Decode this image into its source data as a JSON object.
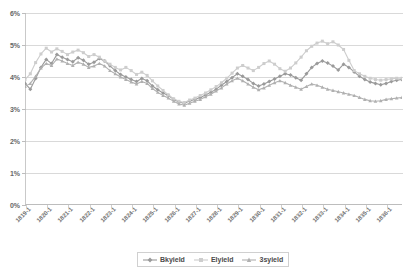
{
  "chart_data": {
    "type": "line",
    "title": "",
    "subtitle": "",
    "xlabel": "",
    "ylabel": "",
    "grid": true,
    "legend_position": "bottom",
    "ylim": [
      0,
      6
    ],
    "ytick_labels": [
      "6%",
      "5%",
      "4%",
      "3%",
      "2%",
      "1%",
      "0%"
    ],
    "ytick_values": [
      6,
      5,
      4,
      3,
      2,
      1,
      0
    ],
    "xtick_labels": [
      "1819-1",
      "1820-1",
      "1821-1",
      "1822-1",
      "1823-1",
      "1824-1",
      "1825-1",
      "1826-1",
      "1827-1",
      "1828-1",
      "1829-1",
      "1830-1",
      "1831-1",
      "1832-1",
      "1833-1",
      "1834-1",
      "1835-1",
      "1836-1"
    ],
    "x_unit": "year-quarter",
    "x_start": "1819-1",
    "x_end": "1836-4",
    "n_points": 72,
    "series": [
      {
        "name": "Bkyield",
        "color": "#9a9a9a",
        "marker": "diamond",
        "values": [
          3.8,
          3.62,
          3.95,
          4.3,
          4.55,
          4.42,
          4.7,
          4.62,
          4.55,
          4.48,
          4.6,
          4.52,
          4.4,
          4.46,
          4.58,
          4.5,
          4.35,
          4.2,
          4.08,
          4.0,
          3.92,
          3.86,
          3.95,
          3.88,
          3.72,
          3.6,
          3.5,
          3.42,
          3.3,
          3.22,
          3.18,
          3.25,
          3.3,
          3.36,
          3.44,
          3.52,
          3.62,
          3.74,
          3.86,
          3.98,
          4.1,
          4.02,
          3.92,
          3.8,
          3.72,
          3.78,
          3.86,
          3.94,
          4.02,
          4.1,
          4.06,
          3.98,
          3.9,
          4.1,
          4.3,
          4.42,
          4.5,
          4.44,
          4.34,
          4.22,
          4.4,
          4.3,
          4.16,
          4.02,
          3.92,
          3.84,
          3.8,
          3.76,
          3.8,
          3.86,
          3.9,
          3.92
        ]
      },
      {
        "name": "Elyield",
        "color": "#cdcdcd",
        "marker": "square",
        "values": [
          3.92,
          4.1,
          4.45,
          4.72,
          4.9,
          4.78,
          4.88,
          4.8,
          4.7,
          4.78,
          4.84,
          4.76,
          4.64,
          4.7,
          4.62,
          4.5,
          4.4,
          4.3,
          4.22,
          4.3,
          4.2,
          4.08,
          4.15,
          4.05,
          3.88,
          3.72,
          3.58,
          3.44,
          3.32,
          3.24,
          3.2,
          3.28,
          3.34,
          3.42,
          3.5,
          3.6,
          3.7,
          3.82,
          3.96,
          4.12,
          4.28,
          4.36,
          4.28,
          4.2,
          4.3,
          4.42,
          4.5,
          4.4,
          4.26,
          4.18,
          4.28,
          4.44,
          4.62,
          4.82,
          4.96,
          5.06,
          5.12,
          5.04,
          5.1,
          5.0,
          4.86,
          4.52,
          4.2,
          4.1,
          4.02,
          3.96,
          3.92,
          3.9,
          3.92,
          3.94,
          3.96,
          3.96
        ]
      },
      {
        "name": "3syield",
        "color": "#b0b0b0",
        "marker": "triangle",
        "values": [
          3.7,
          3.8,
          4.02,
          4.28,
          4.42,
          4.36,
          4.56,
          4.5,
          4.42,
          4.36,
          4.46,
          4.4,
          4.3,
          4.34,
          4.42,
          4.34,
          4.2,
          4.1,
          4.0,
          3.92,
          3.84,
          3.78,
          3.86,
          3.8,
          3.64,
          3.52,
          3.42,
          3.34,
          3.24,
          3.16,
          3.12,
          3.18,
          3.24,
          3.3,
          3.38,
          3.46,
          3.56,
          3.66,
          3.78,
          3.88,
          3.96,
          3.88,
          3.78,
          3.68,
          3.6,
          3.66,
          3.74,
          3.82,
          3.88,
          3.82,
          3.74,
          3.68,
          3.62,
          3.7,
          3.78,
          3.74,
          3.68,
          3.62,
          3.58,
          3.54,
          3.5,
          3.46,
          3.42,
          3.36,
          3.3,
          3.26,
          3.24,
          3.26,
          3.3,
          3.32,
          3.34,
          3.36
        ]
      }
    ]
  },
  "legend": {
    "items": [
      {
        "label": "Bkyield"
      },
      {
        "label": "Elyield"
      },
      {
        "label": "3syield"
      }
    ]
  }
}
